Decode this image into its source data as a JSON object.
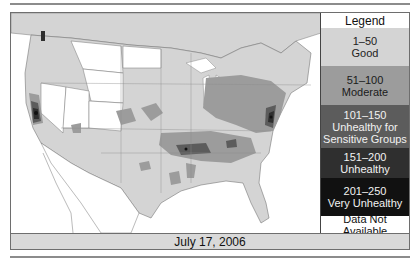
{
  "map": {
    "title": "Air Quality Index map",
    "region": "Contiguous United States",
    "date": "July 17, 2006"
  },
  "legend": {
    "title": "Legend",
    "items": [
      {
        "range": "1–50",
        "label": "Good",
        "color": "#d4d4d4",
        "text_color": "#222222"
      },
      {
        "range": "51–100",
        "label": "Moderate",
        "color": "#9c9c9c",
        "text_color": "#1a1a1a"
      },
      {
        "range": "101–150",
        "label": "Unhealthy for Sensitive Groups",
        "color": "#5c5c5c",
        "text_color": "#f2f2f2"
      },
      {
        "range": "151–200",
        "label": "Unhealthy",
        "color": "#2f2f2f",
        "text_color": "#f2f2f2"
      },
      {
        "range": "201–250",
        "label": "Very Unhealthy",
        "color": "#111111",
        "text_color": "#f2f2f2"
      },
      {
        "range": "",
        "label": "Data Not Available",
        "color": "#ffffff",
        "text_color": "#111111"
      }
    ]
  },
  "colors": {
    "good": "#d4d4d4",
    "moderate": "#9c9c9c",
    "usg": "#5c5c5c",
    "unhealthy": "#2f2f2f",
    "very_unhealthy": "#111111",
    "no_data": "#ffffff",
    "date_bar": "#d9d9d9"
  }
}
